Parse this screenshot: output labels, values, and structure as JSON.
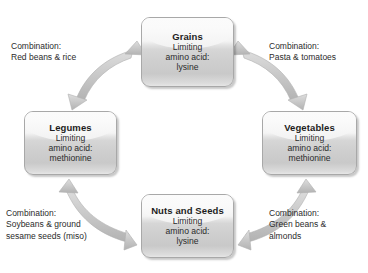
{
  "diagram": {
    "type": "cycle",
    "arrow_color": "#c2c2c2",
    "arrow_style": "double-headed-curved",
    "box_border_color": "#a8a8a8",
    "text_color": "#2b2b2b",
    "background": "#ffffff",
    "nodes": [
      {
        "id": "grains",
        "title": "Grains",
        "lines": [
          "Limiting",
          "amino acid:",
          "lysine"
        ],
        "limiting_amino_acid": "lysine",
        "position": "top"
      },
      {
        "id": "legumes",
        "title": "Legumes",
        "lines": [
          "Limiting",
          "amino acid:",
          "methionine"
        ],
        "limiting_amino_acid": "methionine",
        "position": "left"
      },
      {
        "id": "vegetables",
        "title": "Vegetables",
        "lines": [
          "Limiting",
          "amino acid:",
          "methionine"
        ],
        "limiting_amino_acid": "methionine",
        "position": "right"
      },
      {
        "id": "nuts",
        "title": "Nuts and Seeds",
        "lines": [
          "Limiting",
          "amino acid:",
          "lysine"
        ],
        "limiting_amino_acid": "lysine",
        "position": "bottom"
      }
    ],
    "captions": [
      {
        "id": "legumes-grains",
        "corner": "top-left",
        "label": "Combination:",
        "lines": [
          "Red beans & rice"
        ],
        "connects": [
          "legumes",
          "grains"
        ]
      },
      {
        "id": "grains-vegetables",
        "corner": "top-right",
        "label": "Combination:",
        "lines": [
          "Pasta & tomatoes"
        ],
        "connects": [
          "grains",
          "vegetables"
        ]
      },
      {
        "id": "nuts-legumes",
        "corner": "bottom-left",
        "label": "Combination:",
        "lines": [
          "Soybeans & ground",
          "sesame seeds (miso)"
        ],
        "connects": [
          "nuts",
          "legumes"
        ]
      },
      {
        "id": "vegetables-nuts",
        "corner": "bottom-right",
        "label": "Combination:",
        "lines": [
          "Green beans &",
          "almonds"
        ],
        "connects": [
          "vegetables",
          "nuts"
        ]
      }
    ]
  }
}
